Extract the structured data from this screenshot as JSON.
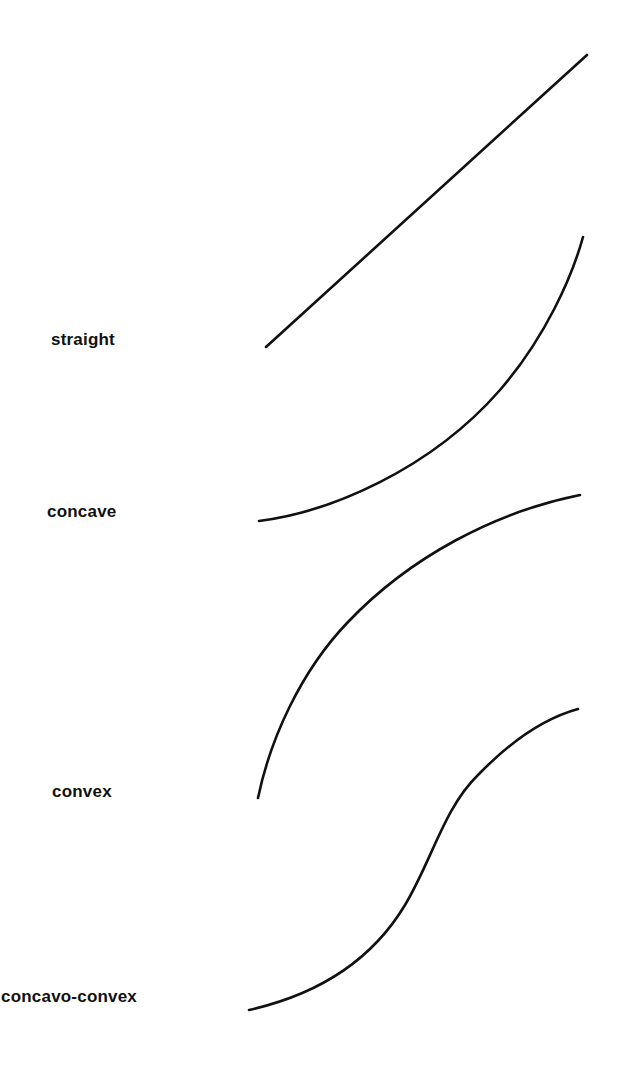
{
  "figure": {
    "type": "diagram",
    "background_color": "#ffffff",
    "stroke_color": "#111111",
    "text_color": "#111111",
    "width": 623,
    "height": 1070,
    "label_font_weight": "bold",
    "label_font_size_px": 17
  },
  "curves": [
    {
      "id": "straight",
      "label": "straight",
      "shape": "line",
      "description": "A straight line rising from lower-left to upper-right at a constant slope.",
      "start_point": [
        266,
        347
      ],
      "end_point": [
        587,
        55
      ],
      "path": "M 266 347 L 587 55",
      "label_position": [
        51,
        331
      ]
    },
    {
      "id": "concave",
      "label": "concave",
      "shape": "curve",
      "description": "A concave (upward-bending) curve: nearly flat at the left, becoming increasingly steep toward the right.",
      "start_point": [
        259,
        521
      ],
      "end_point": [
        583,
        237
      ],
      "path": "M 259 521 C 330 512, 430 470, 500 390 C 545 338, 572 277, 583 237",
      "label_position": [
        47,
        503
      ]
    },
    {
      "id": "convex",
      "label": "convex",
      "shape": "curve",
      "description": "A convex (downward-bending) curve: very steep at the left, flattening out toward the right.",
      "start_point": [
        258,
        798
      ],
      "end_point": [
        580,
        495
      ],
      "path": "M 258 798 C 270 740, 300 672, 348 622 C 410 557, 495 512, 580 495",
      "label_position": [
        52,
        783
      ]
    },
    {
      "id": "concavo-convex",
      "label": "concavo-convex",
      "shape": "curve",
      "description": "An S-shaped curve: concave at the left half, then convex at the right half (an inflection point near the middle).",
      "start_point": [
        249,
        1010
      ],
      "end_point": [
        578,
        709
      ],
      "path": "M 249 1010 C 320 994, 372 960, 405 905 C 432 860, 444 808, 478 775 C 510 742, 545 718, 578 709",
      "label_position": [
        1,
        988
      ]
    }
  ]
}
